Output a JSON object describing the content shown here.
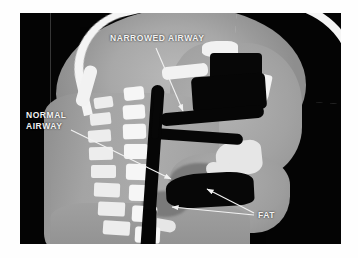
{
  "image": {
    "type": "ct-scan",
    "view": "sagittal",
    "region": "head-and-neck",
    "background_color": "#ffffff",
    "frame_color": "#030303",
    "frame": {
      "x": 20,
      "y": 13,
      "width": 321,
      "height": 231
    }
  },
  "annotations": {
    "label_color": "#f2f2f2",
    "items": [
      {
        "id": "narrowed-airway",
        "text": "NARROWED AIRWAY",
        "label_x": 110,
        "label_y": 33,
        "arrow": {
          "x1": 156,
          "y1": 48,
          "x2": 183,
          "y2": 111
        }
      },
      {
        "id": "normal-airway",
        "text": "NORMAL\nAIRWAY",
        "label_x": 26,
        "label_y": 110,
        "arrow": {
          "x1": 71,
          "y1": 130,
          "x2": 171,
          "y2": 179
        }
      },
      {
        "id": "fat",
        "text": "FAT",
        "label_x": 258,
        "label_y": 210,
        "arrows": [
          {
            "x1": 254,
            "y1": 213,
            "x2": 207,
            "y2": 189
          },
          {
            "x1": 254,
            "y1": 215,
            "x2": 172,
            "y2": 207
          }
        ]
      }
    ]
  },
  "anatomy": {
    "vertebrae": [
      {
        "x": 74,
        "y": 84,
        "w": 19,
        "h": 11,
        "rot": -8
      },
      {
        "x": 70,
        "y": 100,
        "w": 21,
        "h": 12,
        "rot": -6
      },
      {
        "x": 68,
        "y": 117,
        "w": 23,
        "h": 12,
        "rot": -4
      },
      {
        "x": 69,
        "y": 134,
        "w": 24,
        "h": 13,
        "rot": -2
      },
      {
        "x": 71,
        "y": 152,
        "w": 25,
        "h": 13,
        "rot": 0
      },
      {
        "x": 74,
        "y": 170,
        "w": 26,
        "h": 14,
        "rot": 2
      },
      {
        "x": 78,
        "y": 189,
        "w": 27,
        "h": 14,
        "rot": 3
      },
      {
        "x": 83,
        "y": 208,
        "w": 27,
        "h": 14,
        "rot": 4
      }
    ],
    "vertebral_bodies": [
      {
        "x": 104,
        "y": 74,
        "w": 20,
        "h": 13,
        "rot": -6
      },
      {
        "x": 103,
        "y": 92,
        "w": 22,
        "h": 14,
        "rot": -4
      },
      {
        "x": 103,
        "y": 111,
        "w": 23,
        "h": 15,
        "rot": -2
      },
      {
        "x": 104,
        "y": 131,
        "w": 24,
        "h": 15,
        "rot": 0
      },
      {
        "x": 106,
        "y": 151,
        "w": 25,
        "h": 16,
        "rot": 1
      },
      {
        "x": 109,
        "y": 172,
        "w": 25,
        "h": 16,
        "rot": 2
      },
      {
        "x": 112,
        "y": 193,
        "w": 25,
        "h": 16,
        "rot": 3
      },
      {
        "x": 115,
        "y": 214,
        "w": 25,
        "h": 16,
        "rot": 3
      }
    ],
    "palate": {
      "x": 176,
      "y": 108,
      "w": 78,
      "h": 9
    },
    "tongue": {
      "x": 150,
      "y": 120,
      "w": 92,
      "h": 52
    },
    "mandible": {
      "x": 208,
      "y": 140,
      "w": 58,
      "h": 22
    },
    "hyoid": {
      "x": 148,
      "y": 148,
      "w": 10,
      "h": 9
    }
  }
}
